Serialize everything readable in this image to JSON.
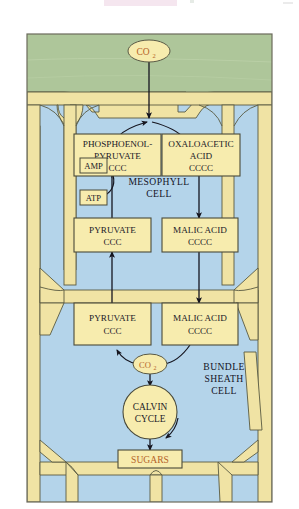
{
  "figure": {
    "title_semantic": "c4-photosynthesis-pathway",
    "colors": {
      "page_background": "#ffffff",
      "leaf_green": "#aec69a",
      "cytoplasm_blue": "#b4d4ea",
      "cell_wall_yellow": "#f0e3a4",
      "box_fill": "#f7ecae",
      "box_stroke": "#4a4a3a",
      "outline": "#555548",
      "text_dark": "#1a1a28",
      "text_orange": "#b5642a",
      "arrow": "#15151f"
    }
  },
  "nodes": {
    "co2_top": {
      "label": "CO",
      "subscript": "2"
    },
    "co2_bundle": {
      "label": "CO",
      "subscript": "2"
    },
    "pep": {
      "line1": "PHOSPHOENOL-",
      "line2": "PYRUVATE",
      "line3": "CCC"
    },
    "oaa": {
      "line1": "OXALOACETIC",
      "line2": "ACID",
      "line3": "CCCC"
    },
    "amp": {
      "label": "AMP"
    },
    "atp": {
      "label": "ATP"
    },
    "pyruvate_meso": {
      "line1": "PYRUVATE",
      "line2": "CCC"
    },
    "malic_meso": {
      "line1": "MALIC ACID",
      "line2": "CCCC"
    },
    "pyruvate_bundle": {
      "line1": "PYRUVATE",
      "line2": "CCC"
    },
    "malic_bundle": {
      "line1": "MALIC ACID",
      "line2": "CCCC"
    },
    "calvin": {
      "line1": "CALVIN",
      "line2": "CYCLE"
    },
    "sugars": {
      "label": "SUGARS"
    }
  },
  "cell_labels": {
    "mesophyll": {
      "line1": "MESOPHYLL",
      "line2": "CELL"
    },
    "bundle_sheath": {
      "line1": "BUNDLE",
      "line2": "SHEATH",
      "line3": "CELL"
    }
  }
}
